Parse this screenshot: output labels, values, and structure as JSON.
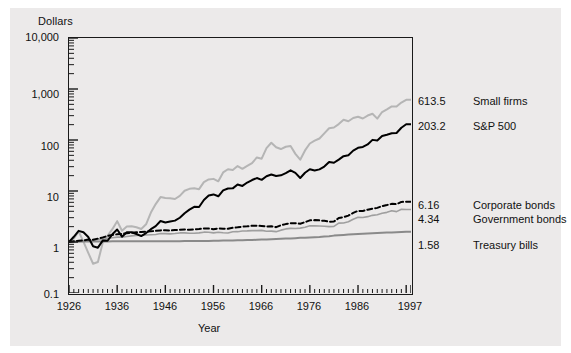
{
  "figure": {
    "background": "#ffffff",
    "panel_background": "#eceaea"
  },
  "chart_data": {
    "type": "line",
    "title": "",
    "xlabel": "Year",
    "ylabel": "Dollars",
    "yscale": "log",
    "ylim": [
      0.1,
      10000
    ],
    "xlim": [
      1926,
      1997
    ],
    "grid": false,
    "legend_position": "right-of-axes-inline-labels",
    "ytick_labels": [
      "10,000",
      "1,000",
      "100",
      "10",
      "1",
      "0.1"
    ],
    "ytick_values": [
      10000,
      1000,
      100,
      10,
      1,
      0.1
    ],
    "xtick_labels": [
      "1926",
      "1936",
      "1946",
      "1956",
      "1966",
      "1976",
      "1986",
      "1997"
    ],
    "xtick_values": [
      1926,
      1936,
      1946,
      1956,
      1966,
      1976,
      1986,
      1997
    ],
    "end_values": {
      "small_firms": "613.5",
      "sp500": "203.2",
      "corporate_bonds": "6.16",
      "government_bonds": "4.34",
      "treasury_bills": "1.58"
    },
    "series": [
      {
        "name": "Small firms",
        "final_value": 613.5,
        "color": "#b5b5b5",
        "style": "solid",
        "width": 2.0,
        "x": [
          1926,
          1927,
          1928,
          1929,
          1930,
          1931,
          1932,
          1933,
          1934,
          1935,
          1936,
          1937,
          1938,
          1939,
          1940,
          1941,
          1942,
          1943,
          1944,
          1945,
          1946,
          1947,
          1948,
          1949,
          1950,
          1951,
          1952,
          1953,
          1954,
          1955,
          1956,
          1957,
          1958,
          1959,
          1960,
          1961,
          1962,
          1963,
          1964,
          1965,
          1966,
          1967,
          1968,
          1969,
          1970,
          1971,
          1972,
          1973,
          1974,
          1975,
          1976,
          1977,
          1978,
          1979,
          1980,
          1981,
          1982,
          1983,
          1984,
          1985,
          1986,
          1987,
          1988,
          1989,
          1990,
          1991,
          1992,
          1993,
          1994,
          1995,
          1996,
          1997
        ],
        "y": [
          1.0,
          1.22,
          1.85,
          1.02,
          0.53,
          0.28,
          0.31,
          0.95,
          1.43,
          2.12,
          3.39,
          1.94,
          2.47,
          2.52,
          2.37,
          2.15,
          2.82,
          5.63,
          9.23,
          13.9,
          13.2,
          13.0,
          12.4,
          14.9,
          20.1,
          22.5,
          23.2,
          22.1,
          33.5,
          39.2,
          40.4,
          35.0,
          59.0,
          71.0,
          68.0,
          85.6,
          73.0,
          86.0,
          102.0,
          142.0,
          132.0,
          245.0,
          336.0,
          257.0,
          232.0,
          265.0,
          277.0,
          175.0,
          124.0,
          214.0,
          321.0,
          378.0,
          430.0,
          580.0,
          787.0,
          821.0,
          1000.0,
          1290.0,
          1180.0,
          1430.0,
          1540.0,
          1390.0,
          1650.0,
          1830.0,
          1380.0,
          2030.0,
          2370.0,
          2820.0,
          2790.0,
          3530.0,
          4150.0,
          613.5
        ]
      },
      {
        "name": "S&P 500",
        "final_value": 203.2,
        "color": "#000000",
        "style": "solid",
        "width": 2.0,
        "x": [
          1926,
          1927,
          1928,
          1929,
          1930,
          1931,
          1932,
          1933,
          1934,
          1935,
          1936,
          1937,
          1938,
          1939,
          1940,
          1941,
          1942,
          1943,
          1944,
          1945,
          1946,
          1947,
          1948,
          1949,
          1950,
          1951,
          1952,
          1953,
          1954,
          1955,
          1956,
          1957,
          1958,
          1959,
          1960,
          1961,
          1962,
          1963,
          1964,
          1965,
          1966,
          1967,
          1968,
          1969,
          1970,
          1971,
          1972,
          1973,
          1974,
          1975,
          1976,
          1977,
          1978,
          1979,
          1980,
          1981,
          1982,
          1983,
          1984,
          1985,
          1986,
          1987,
          1988,
          1989,
          1990,
          1991,
          1992,
          1993,
          1994,
          1995,
          1996,
          1997
        ],
        "y": [
          1.0,
          1.37,
          1.96,
          1.8,
          1.35,
          0.77,
          0.71,
          1.09,
          1.08,
          1.59,
          2.13,
          1.38,
          1.81,
          1.8,
          1.62,
          1.43,
          1.72,
          2.17,
          2.6,
          3.55,
          3.26,
          3.45,
          3.64,
          4.33,
          5.7,
          7.07,
          8.37,
          8.29,
          12.66,
          16.67,
          17.76,
          15.84,
          22.73,
          25.45,
          25.57,
          32.45,
          29.61,
          36.37,
          42.36,
          47.67,
          42.86,
          53.11,
          58.98,
          53.96,
          56.12,
          64.13,
          76.31,
          65.1,
          47.86,
          65.7,
          81.38,
          75.56,
          80.52,
          95.36,
          126.3,
          120.1,
          145.9,
          178.8,
          190.1,
          250.4,
          297.0,
          312.6,
          364.3,
          479.6,
          464.6,
          606.1,
          652.3,
          717.9,
          727.4,
          1000.0,
          1229.2,
          203.2
        ]
      },
      {
        "name": "Corporate bonds",
        "final_value": 6.16,
        "color": "#000000",
        "style": "dashed",
        "width": 2.0,
        "x": [
          1926,
          1927,
          1928,
          1929,
          1930,
          1931,
          1932,
          1933,
          1934,
          1935,
          1936,
          1937,
          1938,
          1939,
          1940,
          1941,
          1942,
          1943,
          1944,
          1945,
          1946,
          1947,
          1948,
          1949,
          1950,
          1951,
          1952,
          1953,
          1954,
          1955,
          1956,
          1957,
          1958,
          1959,
          1960,
          1961,
          1962,
          1963,
          1964,
          1965,
          1966,
          1967,
          1968,
          1969,
          1970,
          1971,
          1972,
          1973,
          1974,
          1975,
          1976,
          1977,
          1978,
          1979,
          1980,
          1981,
          1982,
          1983,
          1984,
          1985,
          1986,
          1987,
          1988,
          1989,
          1990,
          1991,
          1992,
          1993,
          1994,
          1995,
          1996,
          1997
        ],
        "y": [
          1.0,
          1.07,
          1.11,
          1.15,
          1.24,
          1.22,
          1.35,
          1.49,
          1.7,
          1.86,
          1.99,
          2.05,
          2.18,
          2.27,
          2.35,
          2.42,
          2.49,
          2.56,
          2.68,
          2.79,
          2.84,
          2.77,
          2.87,
          2.97,
          3.03,
          2.95,
          3.05,
          3.15,
          3.32,
          3.3,
          3.07,
          3.32,
          3.25,
          3.21,
          3.5,
          3.65,
          3.89,
          4.01,
          4.2,
          4.17,
          4.15,
          3.95,
          4.04,
          3.7,
          4.38,
          4.86,
          5.21,
          5.25,
          5.04,
          5.8,
          6.79,
          6.92,
          6.75,
          6.48,
          6.01,
          6.12,
          8.3,
          8.97,
          10.3,
          13.1,
          15.7,
          15.5,
          17.3,
          19.1,
          20.4,
          23.9,
          26.2,
          29.1,
          28.3,
          34.5,
          35.1,
          6.16
        ]
      },
      {
        "name": "Government bonds",
        "final_value": 4.34,
        "color": "#9f9f9f",
        "style": "solid",
        "width": 1.6,
        "x": [
          1926,
          1927,
          1928,
          1929,
          1930,
          1931,
          1932,
          1933,
          1934,
          1935,
          1936,
          1937,
          1938,
          1939,
          1940,
          1941,
          1942,
          1943,
          1944,
          1945,
          1946,
          1947,
          1948,
          1949,
          1950,
          1951,
          1952,
          1953,
          1954,
          1955,
          1956,
          1957,
          1958,
          1959,
          1960,
          1961,
          1962,
          1963,
          1964,
          1965,
          1966,
          1967,
          1968,
          1969,
          1970,
          1971,
          1972,
          1973,
          1974,
          1975,
          1976,
          1977,
          1978,
          1979,
          1980,
          1981,
          1982,
          1983,
          1984,
          1985,
          1986,
          1987,
          1988,
          1989,
          1990,
          1991,
          1992,
          1993,
          1994,
          1995,
          1996,
          1997
        ],
        "y": [
          1.0,
          1.09,
          1.09,
          1.13,
          1.18,
          1.12,
          1.31,
          1.31,
          1.44,
          1.55,
          1.67,
          1.67,
          1.78,
          1.89,
          1.99,
          2.01,
          2.07,
          2.12,
          2.18,
          2.41,
          2.41,
          2.34,
          2.42,
          2.58,
          2.58,
          2.48,
          2.51,
          2.6,
          2.79,
          2.75,
          2.59,
          2.78,
          2.62,
          2.56,
          2.91,
          2.94,
          3.15,
          3.18,
          3.29,
          3.27,
          3.38,
          3.08,
          3.1,
          2.95,
          3.45,
          3.92,
          4.14,
          4.09,
          4.27,
          4.66,
          5.4,
          5.36,
          5.29,
          5.21,
          4.99,
          5.08,
          7.17,
          7.32,
          8.24,
          10.8,
          13.2,
          12.9,
          14.1,
          16.2,
          17.1,
          20.1,
          22.1,
          25.9,
          23.8,
          30.3,
          29.8,
          4.34
        ]
      },
      {
        "name": "Treasury bills",
        "final_value": 1.58,
        "color": "#8a8a8a",
        "style": "solid",
        "width": 2.0,
        "x": [
          1926,
          1927,
          1928,
          1929,
          1930,
          1931,
          1932,
          1933,
          1934,
          1935,
          1936,
          1937,
          1938,
          1939,
          1940,
          1941,
          1942,
          1943,
          1944,
          1945,
          1946,
          1947,
          1948,
          1949,
          1950,
          1951,
          1952,
          1953,
          1954,
          1955,
          1956,
          1957,
          1958,
          1959,
          1960,
          1961,
          1962,
          1963,
          1964,
          1965,
          1966,
          1967,
          1968,
          1969,
          1970,
          1971,
          1972,
          1973,
          1974,
          1975,
          1976,
          1977,
          1978,
          1979,
          1980,
          1981,
          1982,
          1983,
          1984,
          1985,
          1986,
          1987,
          1988,
          1989,
          1990,
          1991,
          1992,
          1993,
          1994,
          1995,
          1996,
          1997
        ],
        "y": [
          1.0,
          1.03,
          1.07,
          1.12,
          1.14,
          1.16,
          1.17,
          1.17,
          1.17,
          1.18,
          1.18,
          1.18,
          1.18,
          1.18,
          1.18,
          1.18,
          1.18,
          1.19,
          1.19,
          1.2,
          1.2,
          1.21,
          1.22,
          1.23,
          1.25,
          1.26,
          1.28,
          1.3,
          1.31,
          1.33,
          1.36,
          1.4,
          1.42,
          1.46,
          1.5,
          1.53,
          1.58,
          1.63,
          1.68,
          1.75,
          1.83,
          1.91,
          2.01,
          2.14,
          2.28,
          2.38,
          2.47,
          2.65,
          2.86,
          3.03,
          3.18,
          3.34,
          3.58,
          3.96,
          4.41,
          5.07,
          5.62,
          6.11,
          6.71,
          7.24,
          7.69,
          8.11,
          8.69,
          9.43,
          10.16,
          10.72,
          11.1,
          11.43,
          11.87,
          12.53,
          13.17,
          1.58
        ]
      }
    ]
  },
  "axes": {
    "y_axis_title": "Dollars",
    "x_axis_title": "Year"
  },
  "annotations": [
    {
      "value": "613.5",
      "name": "Small firms"
    },
    {
      "value": "203.2",
      "name": "S&P 500"
    },
    {
      "value": "6.16",
      "name": "Corporate bonds"
    },
    {
      "value": "4.34",
      "name": "Government bonds"
    },
    {
      "value": "1.58",
      "name": "Treasury bills"
    }
  ]
}
